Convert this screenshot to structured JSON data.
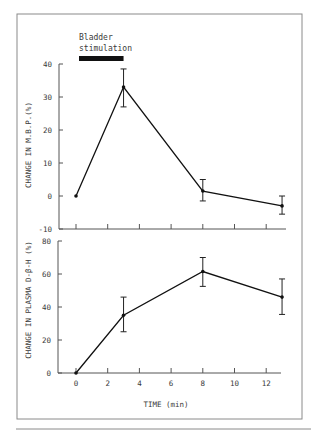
{
  "annotation": {
    "line1": "Bladder",
    "line2": "stimulation",
    "bar_start_min": 0,
    "bar_end_min": 3
  },
  "chart_data": [
    {
      "type": "line",
      "title": "",
      "xlabel": "",
      "ylabel": "CHANGE IN M.B.P.(%)",
      "ylim": [
        -10,
        40
      ],
      "yticks": [
        -10,
        0,
        10,
        20,
        30,
        40
      ],
      "ytick_labels": [
        "-10",
        "0",
        "10",
        "20",
        "30",
        "40"
      ],
      "xlim": [
        -1,
        14
      ],
      "xticks": [
        0,
        2,
        4,
        6,
        8,
        10,
        12
      ],
      "grid": false,
      "legend": null,
      "series": [
        {
          "name": "M.B.P.",
          "x": [
            0,
            3,
            8,
            13
          ],
          "values": [
            0,
            33,
            1.5,
            -3
          ],
          "err_upper": [
            0,
            38.5,
            5,
            0
          ],
          "err_lower": [
            0,
            27,
            -1.5,
            -5.5
          ]
        }
      ]
    },
    {
      "type": "line",
      "title": "",
      "xlabel": "TIME (min)",
      "ylabel": "CHANGE IN PLASMA D-β-H (%)",
      "ylim": [
        0,
        80
      ],
      "yticks": [
        0,
        20,
        40,
        60,
        80
      ],
      "ytick_labels": [
        "0",
        "20",
        "40",
        "60",
        "80"
      ],
      "xlim": [
        -1,
        14
      ],
      "xticks": [
        0,
        2,
        4,
        6,
        8,
        10,
        12
      ],
      "xtick_labels": [
        "0",
        "2",
        "4",
        "6",
        "8",
        "10",
        "12"
      ],
      "grid": false,
      "legend": null,
      "series": [
        {
          "name": "Plasma D-β-H",
          "x": [
            0,
            3,
            8,
            13
          ],
          "values": [
            0,
            35,
            61.5,
            46
          ],
          "err_upper": [
            0,
            46,
            70,
            57
          ],
          "err_lower": [
            0,
            25,
            52.5,
            35.5
          ]
        }
      ]
    }
  ]
}
